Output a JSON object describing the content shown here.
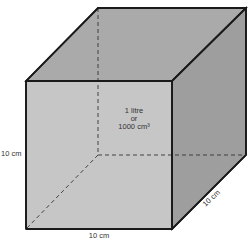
{
  "diagram": {
    "type": "cube",
    "center_label": {
      "line1": "1 litre",
      "line2": "or",
      "line3": "1000 cm³"
    },
    "height_label": "10 cm",
    "width_label": "10 cm",
    "depth_label": "10 cm",
    "colors": {
      "front_face": "#c4c4c4",
      "top_face": "#a9a9a9",
      "right_face": "#9d9d9d",
      "edge": "#1a1a1a"
    }
  }
}
